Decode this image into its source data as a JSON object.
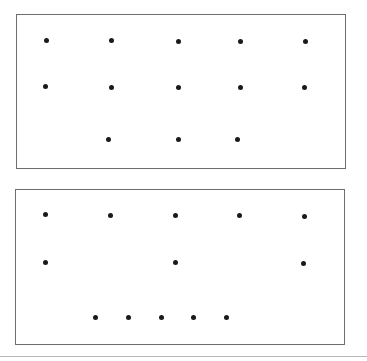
{
  "panels": [
    {
      "name": "dot-panel-top",
      "box": {
        "left": 16,
        "top": 14,
        "width": 330,
        "height": 155
      },
      "dots": [
        {
          "x": 46,
          "y": 40
        },
        {
          "x": 111,
          "y": 40
        },
        {
          "x": 178,
          "y": 41
        },
        {
          "x": 240,
          "y": 41
        },
        {
          "x": 305,
          "y": 41
        },
        {
          "x": 45,
          "y": 86
        },
        {
          "x": 111,
          "y": 87
        },
        {
          "x": 178,
          "y": 87
        },
        {
          "x": 240,
          "y": 87
        },
        {
          "x": 304,
          "y": 87
        },
        {
          "x": 108,
          "y": 139
        },
        {
          "x": 178,
          "y": 139
        },
        {
          "x": 237,
          "y": 139
        }
      ]
    },
    {
      "name": "dot-panel-bottom",
      "box": {
        "left": 15,
        "top": 189,
        "width": 330,
        "height": 156
      },
      "dots": [
        {
          "x": 45,
          "y": 214
        },
        {
          "x": 110,
          "y": 215
        },
        {
          "x": 175,
          "y": 215
        },
        {
          "x": 239,
          "y": 215
        },
        {
          "x": 304,
          "y": 216
        },
        {
          "x": 45,
          "y": 262
        },
        {
          "x": 175,
          "y": 262
        },
        {
          "x": 303,
          "y": 263
        },
        {
          "x": 95,
          "y": 317
        },
        {
          "x": 128,
          "y": 317
        },
        {
          "x": 161,
          "y": 317
        },
        {
          "x": 193,
          "y": 317
        },
        {
          "x": 226,
          "y": 317
        }
      ]
    }
  ],
  "colors": {
    "border": "#6e6e6e",
    "dot": "#1a1a1a",
    "rule": "#b8b8b8"
  }
}
